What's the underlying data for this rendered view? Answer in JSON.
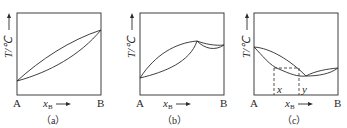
{
  "figure": {
    "panels": [
      {
        "id": "a",
        "caption": "（a）",
        "y_axis_label": "T/℃",
        "x_axis_label": "x",
        "x_axis_subscript": "B",
        "left_end": "A",
        "right_end": "B",
        "description": "Ideal lens-shaped binary liquid–vapor diagram; boiling point rises monotonically from A to B"
      },
      {
        "id": "b",
        "caption": "（b）",
        "y_axis_label": "T/℃",
        "x_axis_label": "x",
        "x_axis_subscript": "B",
        "left_end": "A",
        "right_end": "B",
        "description": "Maximum-boiling azeotrope diagram; two lens regions meeting at a maximum"
      },
      {
        "id": "c",
        "caption": "（c）",
        "y_axis_label": "T/℃",
        "x_axis_label": "x",
        "x_axis_subscript": "B",
        "left_end": "A",
        "right_end": "B",
        "tie_line_labels": [
          "x",
          "y"
        ],
        "description": "Minimum-boiling azeotrope diagram with dashed tie line marking compositions x and y"
      }
    ],
    "colors": {
      "line": "#2a2a2a",
      "background": "#ffffff"
    }
  }
}
